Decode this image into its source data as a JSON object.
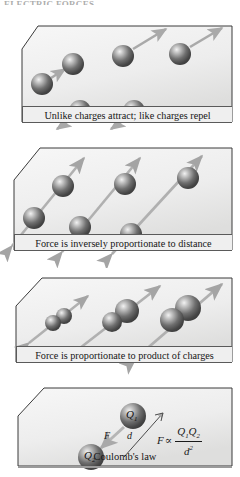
{
  "figure": {
    "cutoff_header": "ELECTRIC FORCES",
    "background": "#ffffff",
    "panel_fill_light": "#f4f4f4",
    "panel_fill_dark": "#dcdcdc",
    "panel_border": "#3a3a3a",
    "sphere_dark": "#4a4a4a",
    "sphere_light": "#e8e8e8",
    "arrow_color": "#aaaaaa",
    "caption_bg": "#efefef",
    "text_color": "#161616"
  },
  "panels": [
    {
      "id": "panel-attract-repel",
      "caption": "Unlike charges attract; like charges repel",
      "spheres": [
        {
          "cx": 42,
          "cy": 74,
          "r": 11
        },
        {
          "cx": 73,
          "cy": 54,
          "r": 11
        },
        {
          "cx": 123,
          "cy": 46,
          "r": 11
        },
        {
          "cx": 180,
          "cy": 44,
          "r": 11
        },
        {
          "cx": 80,
          "cy": 101,
          "r": 11
        },
        {
          "cx": 134,
          "cy": 101,
          "r": 11
        }
      ],
      "arrows": [
        {
          "type": "attract",
          "x1": 51,
          "y1": 68,
          "x2": 65,
          "y2": 59
        },
        {
          "type": "repel",
          "x1": 133,
          "y1": 39,
          "x2": 166,
          "y2": 19
        },
        {
          "type": "repel",
          "x1": 190,
          "y1": 37,
          "x2": 222,
          "y2": 18
        },
        {
          "type": "repel",
          "x1": 73,
          "y1": 108,
          "x2": 57,
          "y2": 119
        },
        {
          "type": "repel",
          "x1": 127,
          "y1": 108,
          "x2": 111,
          "y2": 119
        }
      ]
    },
    {
      "id": "panel-inverse-distance",
      "caption": "Force is inversely proportionate to distance",
      "spheres": [
        {
          "cx": 34,
          "cy": 84,
          "r": 11
        },
        {
          "cx": 63,
          "cy": 52,
          "r": 11
        },
        {
          "cx": 80,
          "cy": 93,
          "r": 11
        },
        {
          "cx": 125,
          "cy": 50,
          "r": 11
        },
        {
          "cx": 131,
          "cy": 100,
          "r": 11
        },
        {
          "cx": 188,
          "cy": 44,
          "r": 11
        }
      ],
      "arrows": [
        {
          "type": "double",
          "x1": 12,
          "y1": 112,
          "x2": 84,
          "y2": 24
        },
        {
          "type": "double",
          "x1": 62,
          "y1": 118,
          "x2": 140,
          "y2": 24
        },
        {
          "type": "double",
          "x1": 112,
          "y1": 120,
          "x2": 202,
          "y2": 22
        }
      ]
    },
    {
      "id": "panel-product-charges",
      "caption": "Force is proportionate to product of charges",
      "pairs": [
        {
          "cx1": 53,
          "cy1": 57,
          "r1": 8,
          "cx2": 64,
          "cy2": 50,
          "r2": 8,
          "ax1": 29,
          "ay1": 77,
          "ax2": 88,
          "ay2": 30
        },
        {
          "cx1": 112,
          "cy1": 56,
          "r1": 10,
          "cx2": 127,
          "cy2": 45,
          "r2": 12,
          "ax1": 80,
          "ay1": 82,
          "ax2": 160,
          "ay2": 20
        },
        {
          "cx1": 172,
          "cy1": 54,
          "r1": 12,
          "cx2": 188,
          "cy2": 42,
          "r2": 13,
          "ax1": 136,
          "ay1": 92,
          "ax2": 222,
          "ay2": 18
        }
      ]
    },
    {
      "id": "panel-coulombs-law",
      "caption": "Coulomb's law",
      "charges": [
        {
          "cx": 133,
          "cy": 42,
          "r": 13,
          "label": "Q",
          "sub": "1"
        },
        {
          "cx": 91,
          "cy": 83,
          "r": 13,
          "label": "Q",
          "sub": "2"
        }
      ],
      "force_label": "F",
      "distance_label": "d",
      "formula": {
        "lhs": "F",
        "relation": "∝",
        "numerator_q1": "Q",
        "numerator_q1_sub": "1",
        "numerator_q2": "Q",
        "numerator_q2_sub": "2",
        "denominator": "d",
        "denominator_exp": "2"
      }
    }
  ]
}
